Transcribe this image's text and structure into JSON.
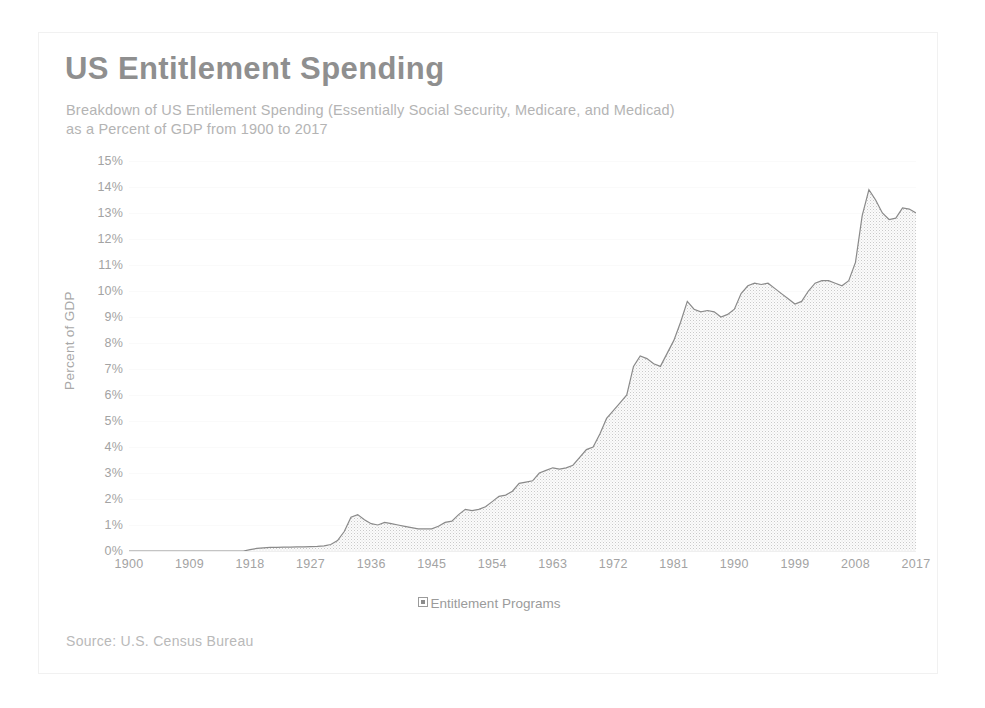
{
  "card": {
    "title": "US Entitlement Spending",
    "subtitle": "Breakdown of US Entilement Spending (Essentially Social Security, Medicare, and Medicad)   as a Percent of GDP from 1900 to 2017",
    "source": "Source: U.S. Census Bureau",
    "legend_label": "Entitlement Programs",
    "legend_marker": "square-marker-icon"
  },
  "colors": {
    "title": "#8f8f8f",
    "subtitle": "#b4b4b4",
    "axis_text": "#a3a3a3",
    "line": "#8a8a8a",
    "fill": "#f2f2f2",
    "gridline": "#fafafa",
    "card_border": "#f1f1f1",
    "source": "#b9b9b9"
  },
  "chart_data": {
    "type": "area",
    "title": "US Entitlement Spending",
    "subtitle": "Breakdown of US Entilement Spending (Essentially Social Security, Medicare, and Medicad)   as a Percent of GDP from 1900 to 2017",
    "xlabel": "",
    "ylabel": "Percent of GDP",
    "ylim": [
      0,
      15
    ],
    "xlim": [
      1900,
      2017
    ],
    "ytick_labels": [
      "0%",
      "1%",
      "2%",
      "3%",
      "4%",
      "5%",
      "6%",
      "7%",
      "8%",
      "9%",
      "10%",
      "11%",
      "12%",
      "13%",
      "14%",
      "15%"
    ],
    "ytick_values": [
      0,
      1,
      2,
      3,
      4,
      5,
      6,
      7,
      8,
      9,
      10,
      11,
      12,
      13,
      14,
      15
    ],
    "xtick_labels": [
      "1900",
      "1909",
      "1918",
      "1927",
      "1936",
      "1945",
      "1954",
      "1963",
      "1972",
      "1981",
      "1990",
      "1999",
      "2008",
      "2017"
    ],
    "xtick_values": [
      1900,
      1909,
      1918,
      1927,
      1936,
      1945,
      1954,
      1963,
      1972,
      1981,
      1990,
      1999,
      2008,
      2017
    ],
    "grid": true,
    "legend_position": "bottom",
    "series": [
      {
        "name": "Entitlement Programs",
        "x": [
          1900,
          1901,
          1902,
          1903,
          1904,
          1905,
          1906,
          1907,
          1908,
          1909,
          1910,
          1911,
          1912,
          1913,
          1914,
          1915,
          1916,
          1917,
          1918,
          1919,
          1920,
          1921,
          1922,
          1923,
          1924,
          1925,
          1926,
          1927,
          1928,
          1929,
          1930,
          1931,
          1932,
          1933,
          1934,
          1935,
          1936,
          1937,
          1938,
          1939,
          1940,
          1941,
          1942,
          1943,
          1944,
          1945,
          1946,
          1947,
          1948,
          1949,
          1950,
          1951,
          1952,
          1953,
          1954,
          1955,
          1956,
          1957,
          1958,
          1959,
          1960,
          1961,
          1962,
          1963,
          1964,
          1965,
          1966,
          1967,
          1968,
          1969,
          1970,
          1971,
          1972,
          1973,
          1974,
          1975,
          1976,
          1977,
          1978,
          1979,
          1980,
          1981,
          1982,
          1983,
          1984,
          1985,
          1986,
          1987,
          1988,
          1989,
          1990,
          1991,
          1992,
          1993,
          1994,
          1995,
          1996,
          1997,
          1998,
          1999,
          2000,
          2001,
          2002,
          2003,
          2004,
          2005,
          2006,
          2007,
          2008,
          2009,
          2010,
          2011,
          2012,
          2013,
          2014,
          2015,
          2016,
          2017
        ],
        "values": [
          0.0,
          0.0,
          0.0,
          0.0,
          0.0,
          0.0,
          0.0,
          0.0,
          0.0,
          0.0,
          0.0,
          0.0,
          0.0,
          0.0,
          0.0,
          0.0,
          0.0,
          0.0,
          0.05,
          0.1,
          0.12,
          0.14,
          0.14,
          0.15,
          0.15,
          0.16,
          0.16,
          0.17,
          0.18,
          0.2,
          0.25,
          0.4,
          0.75,
          1.3,
          1.4,
          1.2,
          1.05,
          1.0,
          1.1,
          1.05,
          1.0,
          0.95,
          0.9,
          0.85,
          0.85,
          0.85,
          0.95,
          1.1,
          1.15,
          1.4,
          1.6,
          1.55,
          1.6,
          1.7,
          1.9,
          2.1,
          2.15,
          2.3,
          2.6,
          2.65,
          2.7,
          3.0,
          3.1,
          3.2,
          3.15,
          3.2,
          3.3,
          3.6,
          3.9,
          4.0,
          4.5,
          5.1,
          5.4,
          5.7,
          6.0,
          7.1,
          7.5,
          7.4,
          7.2,
          7.1,
          7.6,
          8.1,
          8.8,
          9.6,
          9.3,
          9.2,
          9.25,
          9.2,
          9.0,
          9.1,
          9.3,
          9.9,
          10.2,
          10.3,
          10.25,
          10.3,
          10.1,
          9.9,
          9.7,
          9.5,
          9.6,
          10.0,
          10.3,
          10.4,
          10.4,
          10.3,
          10.2,
          10.4,
          11.1,
          12.9,
          13.9,
          13.5,
          13.0,
          12.75,
          12.8,
          13.2,
          13.15,
          13.0
        ]
      }
    ]
  }
}
